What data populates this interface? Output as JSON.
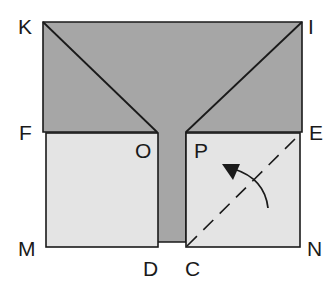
{
  "diagram": {
    "type": "paper-folding",
    "colors": {
      "background": "#ffffff",
      "dark_fill": "#a6a6a6",
      "light_fill": "#e4e4e4",
      "stroke": "#1a1a1a"
    },
    "points": {
      "K": {
        "label": "K",
        "x": 43,
        "y": 22
      },
      "I": {
        "label": "I",
        "x": 302,
        "y": 22
      },
      "F": {
        "label": "F",
        "x": 43,
        "y": 132
      },
      "E": {
        "label": "E",
        "x": 302,
        "y": 132
      },
      "O": {
        "label": "O",
        "x": 157,
        "y": 132
      },
      "P": {
        "label": "P",
        "x": 186,
        "y": 132
      },
      "M": {
        "label": "M",
        "x": 46,
        "y": 247
      },
      "N": {
        "label": "N",
        "x": 300,
        "y": 247
      },
      "D": {
        "label": "D",
        "x": 158,
        "y": 247
      },
      "C": {
        "label": "C",
        "x": 186,
        "y": 247
      }
    },
    "labels": {
      "K": "K",
      "I": "I",
      "F": "F",
      "E": "E",
      "O": "O",
      "P": "P",
      "M": "M",
      "N": "N",
      "D": "D",
      "C": "C"
    },
    "fold_line": {
      "from": "C",
      "to": "E",
      "style": "dashed"
    },
    "arrow": {
      "meaning": "fold direction",
      "direction": "counter-clockwise"
    }
  }
}
